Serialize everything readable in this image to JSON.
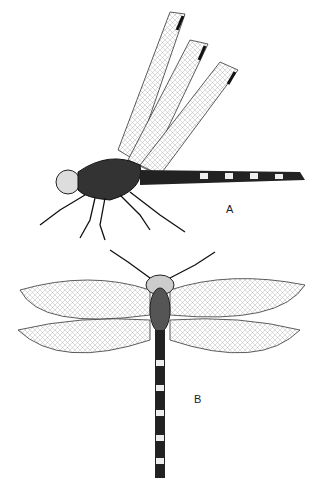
{
  "figure": {
    "label_a": "A",
    "label_b": "B",
    "subject_a": "dragonfly lateral view",
    "subject_b": "dragonfly dorsal view"
  }
}
